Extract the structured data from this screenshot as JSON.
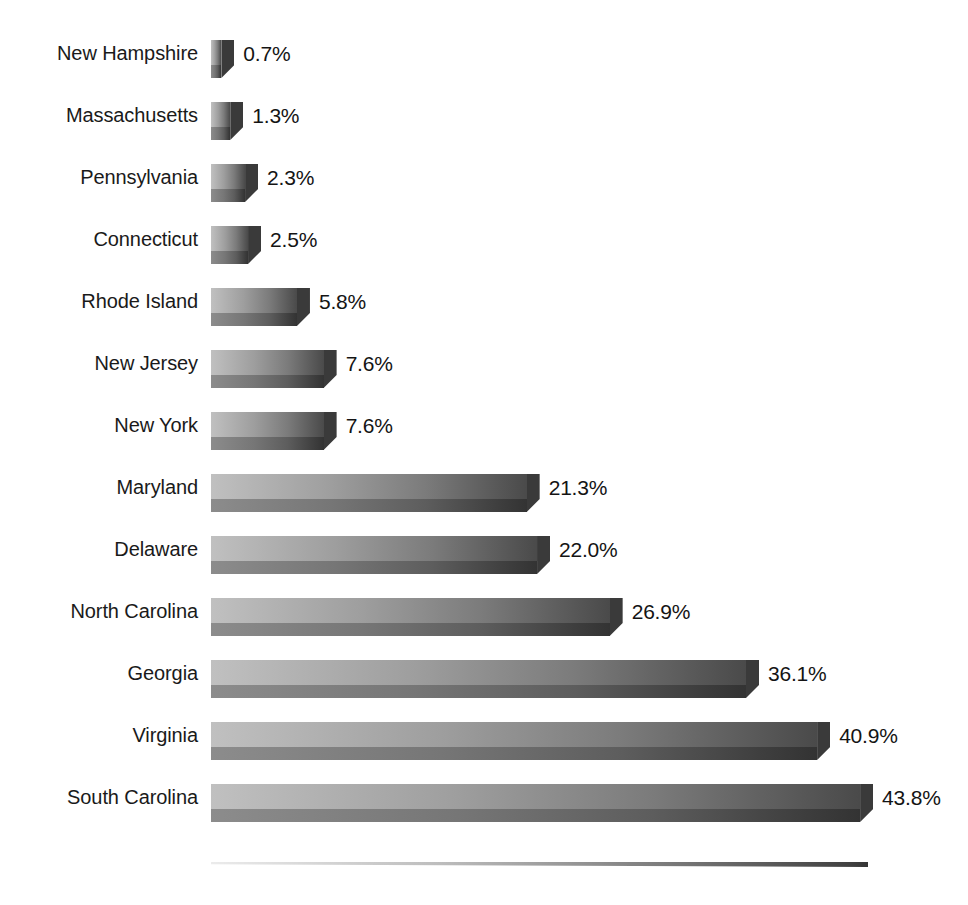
{
  "chart_data": {
    "type": "bar",
    "orientation": "horizontal",
    "title": "",
    "subtitle": "",
    "xlabel": "",
    "ylabel": "",
    "grid": false,
    "legend": null,
    "legend_position": "none",
    "value_suffix": "%",
    "xlim": [
      0,
      43.8
    ],
    "categories": [
      "New Hampshire",
      "Massachusetts",
      "Pennsylvania",
      "Connecticut",
      "Rhode Island",
      "New Jersey",
      "New York",
      "Maryland",
      "Delaware",
      "North Carolina",
      "Georgia",
      "Virginia",
      "South Carolina"
    ],
    "values": [
      0.7,
      1.3,
      2.3,
      2.5,
      5.8,
      7.6,
      7.6,
      21.3,
      22.0,
      26.9,
      36.1,
      40.9,
      43.8
    ],
    "data_labels": [
      "0.7%",
      "1.3%",
      "2.3%",
      "2.5%",
      "5.8%",
      "7.6%",
      "7.6%",
      "21.3%",
      "22.0%",
      "26.9%",
      "36.1%",
      "40.9%",
      "43.8%"
    ],
    "bars": [
      {
        "category": "New Hampshire",
        "value": 0.7,
        "label": "0.7%"
      },
      {
        "category": "Massachusetts",
        "value": 1.3,
        "label": "1.3%"
      },
      {
        "category": "Pennsylvania",
        "value": 2.3,
        "label": "2.3%"
      },
      {
        "category": "Connecticut",
        "value": 2.5,
        "label": "2.5%"
      },
      {
        "category": "Rhode Island",
        "value": 5.8,
        "label": "5.8%"
      },
      {
        "category": "New Jersey",
        "value": 7.6,
        "label": "7.6%"
      },
      {
        "category": "New York",
        "value": 7.6,
        "label": "7.6%"
      },
      {
        "category": "Maryland",
        "value": 21.3,
        "label": "21.3%"
      },
      {
        "category": "Delaware",
        "value": 22.0,
        "label": "22.0%"
      },
      {
        "category": "North Carolina",
        "value": 26.9,
        "label": "26.9%"
      },
      {
        "category": "Georgia",
        "value": 36.1,
        "label": "36.1%"
      },
      {
        "category": "Virginia",
        "value": 40.9,
        "label": "40.9%"
      },
      {
        "category": "South Carolina",
        "value": 43.8,
        "label": "43.8%"
      }
    ],
    "colors": {
      "bar_gradient_start": "#c0c0c0",
      "bar_gradient_end": "#4a4a4a",
      "bar_shadow_start": "#8c8c8c",
      "bar_shadow_end": "#333333",
      "bar_end_cap": "#3a3a3a",
      "label_text": "#1a1a1a",
      "value_text": "#141414",
      "background": "#ffffff"
    }
  },
  "layout": {
    "bar_origin_x": 211,
    "px_per_unit": 14.82,
    "row_height": 62,
    "first_row_top": 40,
    "bar_face_height": 25,
    "bar_shadow_height": 13,
    "cap_width": 13,
    "value_gap": 9
  }
}
